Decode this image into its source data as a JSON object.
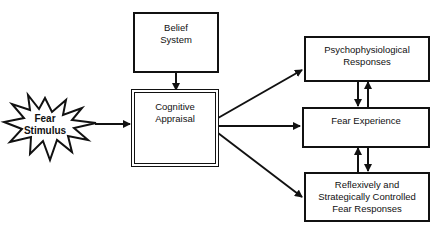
{
  "diagram": {
    "nodes": {
      "belief_system": "Belief\nSystem",
      "cognitive_appraisal": "Cognitive\nAppraisal",
      "fear_stimulus": "Fear\nStimulus",
      "psychophysiological": "Psychophysiological\nResponses",
      "fear_experience": "Fear Experience",
      "controlled_responses": "Reflexively and\nStrategically Controlled\nFear Responses"
    },
    "edges": [
      {
        "from": "fear_stimulus",
        "to": "cognitive_appraisal"
      },
      {
        "from": "belief_system",
        "to": "cognitive_appraisal"
      },
      {
        "from": "cognitive_appraisal",
        "to": "psychophysiological"
      },
      {
        "from": "cognitive_appraisal",
        "to": "fear_experience"
      },
      {
        "from": "cognitive_appraisal",
        "to": "controlled_responses"
      },
      {
        "from": "psychophysiological",
        "to": "fear_experience",
        "bidirectional": true
      },
      {
        "from": "fear_experience",
        "to": "controlled_responses",
        "bidirectional": true
      }
    ]
  }
}
